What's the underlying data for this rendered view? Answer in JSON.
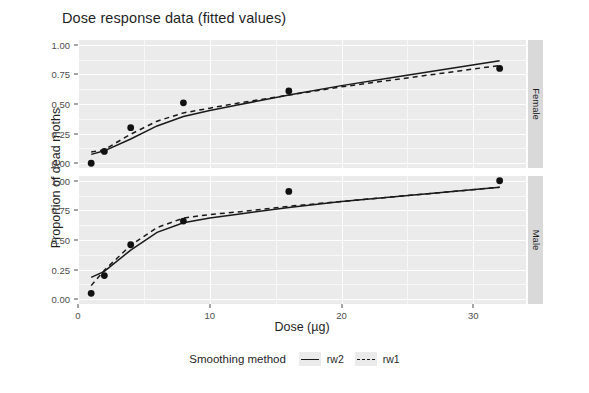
{
  "chart_data": {
    "type": "line",
    "title": "Dose response data (fitted values)",
    "xlabel": "Dose (µg)",
    "ylabel": "Proportion of dead moths",
    "xlim": [
      0,
      34
    ],
    "ylim": [
      -0.04,
      1.04
    ],
    "xticks": [
      0,
      10,
      20,
      30
    ],
    "xtick_labels": [
      "0",
      "10",
      "20",
      "30"
    ],
    "yticks": [
      0.0,
      0.25,
      0.5,
      0.75,
      1.0
    ],
    "ytick_labels": [
      "0.00",
      "0.25",
      "0.50",
      "0.75",
      "1.00"
    ],
    "grid": true,
    "legend_position": "bottom",
    "legend_title": "Smoothing method",
    "facet_labels": [
      "Female",
      "Male"
    ],
    "facets": [
      {
        "name": "Female",
        "x": [
          1,
          2,
          4,
          8,
          16,
          32
        ],
        "points": [
          0.0,
          0.1,
          0.3,
          0.51,
          0.61,
          0.8
        ],
        "series": [
          {
            "name": "rw2",
            "style": "solid",
            "x": [
              1,
              2,
              4,
              6,
              8,
              10,
              12,
              16,
              20,
              24,
              28,
              32
            ],
            "values": [
              0.075,
              0.105,
              0.205,
              0.315,
              0.395,
              0.445,
              0.49,
              0.575,
              0.655,
              0.725,
              0.795,
              0.865
            ]
          },
          {
            "name": "rw1",
            "style": "dashed",
            "x": [
              1,
              2,
              4,
              6,
              8,
              10,
              12,
              16,
              20,
              24,
              28,
              32
            ],
            "values": [
              0.095,
              0.115,
              0.245,
              0.355,
              0.425,
              0.465,
              0.505,
              0.575,
              0.645,
              0.705,
              0.765,
              0.825
            ]
          }
        ]
      },
      {
        "name": "Male",
        "x": [
          1,
          2,
          4,
          8,
          16,
          32
        ],
        "points": [
          0.05,
          0.2,
          0.46,
          0.66,
          0.91,
          1.0
        ],
        "series": [
          {
            "name": "rw2",
            "style": "solid",
            "x": [
              1,
              2,
              4,
              6,
              8,
              10,
              12,
              16,
              20,
              24,
              28,
              32
            ],
            "values": [
              0.185,
              0.235,
              0.415,
              0.565,
              0.645,
              0.685,
              0.715,
              0.775,
              0.825,
              0.865,
              0.905,
              0.945
            ]
          },
          {
            "name": "rw1",
            "style": "dashed",
            "x": [
              1,
              2,
              4,
              6,
              8,
              10,
              12,
              16,
              20,
              24,
              28,
              32
            ],
            "values": [
              0.115,
              0.245,
              0.455,
              0.605,
              0.685,
              0.715,
              0.735,
              0.785,
              0.825,
              0.865,
              0.905,
              0.945
            ]
          }
        ]
      }
    ]
  },
  "legend": {
    "title": "Smoothing method",
    "items": [
      {
        "label": "rw2",
        "style": "solid"
      },
      {
        "label": "rw1",
        "style": "dashed"
      }
    ]
  },
  "colors": {
    "panel_background": "#ebebeb",
    "grid_major": "#ffffff",
    "strip_background": "#d9d9d9",
    "line": "#1a1a1a",
    "point": "#111111",
    "text": "#1f1f1f",
    "page_background": "#ffffff"
  }
}
